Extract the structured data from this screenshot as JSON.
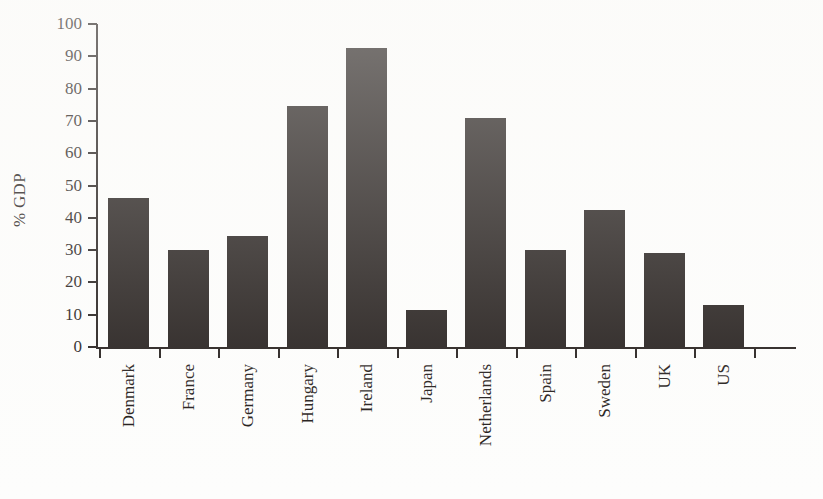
{
  "chart_data": {
    "type": "bar",
    "title": "",
    "subtitle": "",
    "xlabel": "",
    "ylabel": "% GDP",
    "ylim": [
      0,
      100
    ],
    "ytick_step": 10,
    "yticks": [
      "100",
      "90",
      "80",
      "70",
      "60",
      "50",
      "40",
      "30",
      "20",
      "10",
      "0"
    ],
    "grid": false,
    "legend": null,
    "bar_color": "#1a1412",
    "axis_color": "#1a1412",
    "background_color": "#ffffff",
    "categories": [
      "Denmark",
      "France",
      "Germany",
      "Hungary",
      "Ireland",
      "Japan",
      "Netherlands",
      "Spain",
      "Sweden",
      "UK",
      "US"
    ],
    "values": [
      46,
      30,
      34.5,
      74.5,
      92.5,
      11.5,
      71,
      30,
      42.5,
      29,
      13
    ],
    "series": [
      {
        "name": "% GDP",
        "values": [
          46,
          30,
          34.5,
          74.5,
          92.5,
          11.5,
          71,
          30,
          42.5,
          29,
          13
        ]
      }
    ]
  }
}
